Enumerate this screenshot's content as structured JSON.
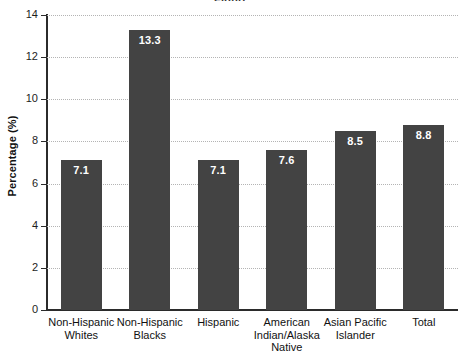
{
  "chart_data": {
    "type": "bar",
    "title": "",
    "xlabel": "",
    "ylabel": "Percentage (%)",
    "ylim": [
      0,
      14
    ],
    "ytick_step": 2,
    "yticks": [
      "14",
      "12",
      "10",
      "8",
      "6",
      "4",
      "2",
      "0"
    ],
    "grid": true,
    "legend": null,
    "bar_color": "#434343",
    "value_label_color": "#ffffff",
    "categories": [
      "Non-Hispanic Whites",
      "Non-Hispanic Blacks",
      "Hispanic",
      "American Indian/Alaska Native",
      "Asian Pacific Islander",
      "Total"
    ],
    "category_lines": [
      [
        "Non-Hispanic",
        "Whites"
      ],
      [
        "Non-Hispanic",
        "Blacks"
      ],
      [
        "Hispanic"
      ],
      [
        "American",
        "Indian/Alaska",
        "Native"
      ],
      [
        "Asian Pacific",
        "Islander"
      ],
      [
        "Total"
      ]
    ],
    "values": [
      7.1,
      13.3,
      7.1,
      7.6,
      8.5,
      8.8
    ],
    "value_labels": [
      "7.1",
      "13.3",
      "7.1",
      "7.6",
      "8.5",
      "8.8"
    ]
  },
  "title_remnant": "Figure"
}
